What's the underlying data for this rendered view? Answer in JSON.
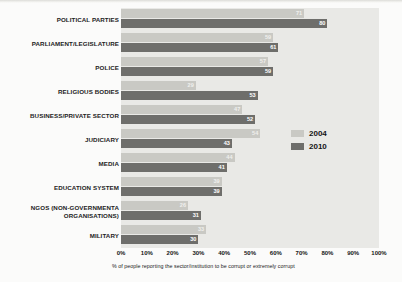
{
  "chart_data": {
    "type": "bar",
    "orientation": "horizontal",
    "title": "",
    "xlabel": "% of people reporting the sector/institution to be corrupt or extremely corrupt",
    "ylabel": "",
    "xlim": [
      0,
      100
    ],
    "grid": false,
    "legend_position": "right",
    "categories": [
      "POLITICAL PARTIES",
      "PARLIAMENT/LEGISLATURE",
      "POLICE",
      "RELIGIOUS BODIES",
      "BUSINESS/PRIVATE SECTOR",
      "JUDICIARY",
      "MEDIA",
      "EDUCATION SYSTEM",
      "NGOS (NON-GOVERNMENTA\nORGANISATIONS)",
      "MILITARY"
    ],
    "series": [
      {
        "name": "2004",
        "color": "#c9c9c4",
        "values": [
          71,
          59,
          57,
          29,
          47,
          54,
          44,
          39,
          26,
          33
        ]
      },
      {
        "name": "2010",
        "color": "#6e6e6b",
        "values": [
          80,
          61,
          59,
          53,
          52,
          43,
          41,
          39,
          31,
          30
        ]
      }
    ],
    "xticks": [
      "0%",
      "10%",
      "20%",
      "30%",
      "40%",
      "50%",
      "60%",
      "70%",
      "80%",
      "90%",
      "100%"
    ],
    "xtick_values": [
      0,
      10,
      20,
      30,
      40,
      50,
      60,
      70,
      80,
      90,
      100
    ]
  },
  "legend": {
    "items": [
      {
        "label": "2004",
        "color": "#c9c9c4"
      },
      {
        "label": "2010",
        "color": "#6e6e6b"
      }
    ]
  }
}
